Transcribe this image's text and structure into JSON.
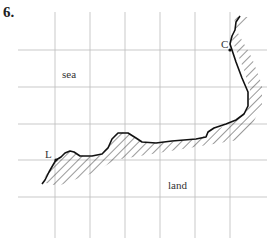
{
  "question_number": "6.",
  "labels": {
    "sea": "sea",
    "land": "land",
    "point_c": "C",
    "point_l": "L"
  },
  "grid": {
    "vertical_lines_x": [
      55,
      90,
      125,
      160,
      195,
      230
    ],
    "horizontal_lines_y": [
      50,
      87,
      124,
      160,
      197
    ],
    "x_range": [
      18,
      267
    ],
    "y_range": [
      12,
      238
    ],
    "color": "#bbbbbb"
  },
  "coastline": {
    "color": "#111111",
    "hatch_color": "#333333"
  }
}
